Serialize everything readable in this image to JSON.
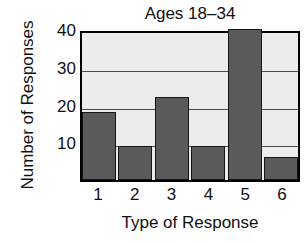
{
  "chart_data": {
    "type": "bar",
    "title": "Ages 18–34",
    "xlabel": "Type of Response",
    "ylabel": "Number of Responses",
    "categories": [
      "1",
      "2",
      "3",
      "4",
      "5",
      "6"
    ],
    "values": [
      18,
      9,
      22,
      9,
      40,
      6
    ],
    "yticks": [
      10,
      20,
      30,
      40
    ],
    "ylim": [
      0,
      40
    ],
    "grid": true,
    "legend": null,
    "colors": {
      "bar_fill": "#5a5a5a",
      "bar_edge": "#151515",
      "plot_background": "#ececec",
      "frame": "#000000",
      "gridline": "#4a4a4a",
      "text": "#111111"
    }
  }
}
